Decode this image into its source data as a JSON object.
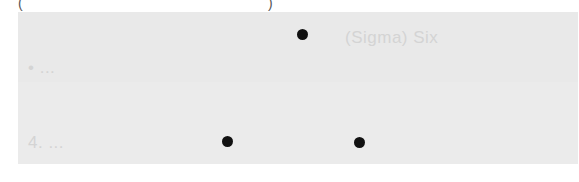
{
  "top_marks": {
    "left": "(",
    "right": ")"
  },
  "ghost_lines": [
    {
      "text": "(Sigma) Six",
      "approximate": true
    },
    {
      "text": "• ...",
      "approximate": true
    },
    {
      "text": "4. ...",
      "approximate": true
    }
  ],
  "dots": [
    {
      "id": "top",
      "x": 303,
      "y": 35
    },
    {
      "id": "bottom-left",
      "x": 228,
      "y": 142
    },
    {
      "id": "bottom-right",
      "x": 360,
      "y": 143
    }
  ],
  "colors": {
    "panel": "#e9e9e9",
    "dot": "#111111",
    "ghost_text": "#d4d4d4"
  }
}
